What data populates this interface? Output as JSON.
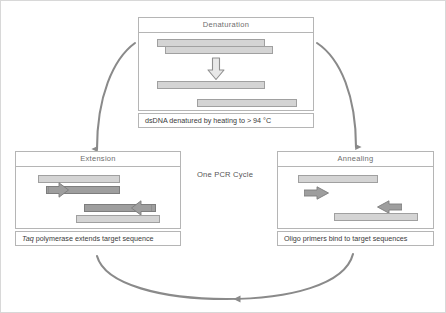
{
  "diagram": {
    "title": "One PCR Cycle",
    "center_label": "One PCR Cycle",
    "accent_color": "#8a8a8a",
    "strand_light_color": "#d4d4d4",
    "strand_dark_color": "#9e9e9e",
    "border_color": "#b5b5b5"
  },
  "stages": {
    "denaturation": {
      "header": "Denaturation",
      "caption": "dsDNA denatured by heating to > 94 °C",
      "elements": {
        "top_strand_label": "double-stranded DNA upper strand",
        "bottom_strand_label": "double-stranded DNA lower strand",
        "transition_arrow": "down-arrow",
        "separated_strand_1": "separated single strand 1",
        "separated_strand_2": "separated single strand 2"
      }
    },
    "annealing": {
      "header": "Annealing",
      "caption": "Oligo primers bind to target sequences",
      "elements": {
        "template_strand_1": "template strand top",
        "primer_1": "forward primer arrow",
        "template_strand_2": "template strand bottom",
        "primer_2": "reverse primer arrow"
      }
    },
    "extension": {
      "header": "Extension",
      "caption_prefix": "Taq",
      "caption_rest": " polymerase extends target sequence",
      "caption": "Taq polymerase extends target sequence",
      "elements": {
        "template_strand_1": "template strand top",
        "extending_strand_1": "extending strand with polymerase arrowhead",
        "template_strand_2": "template strand bottom",
        "extending_strand_2": "extending strand with polymerase arrowhead reverse"
      }
    }
  },
  "arrows": {
    "left_arc": "extension-to-denaturation",
    "right_arc": "denaturation-to-annealing",
    "bottom_arc": "annealing-to-extension"
  }
}
